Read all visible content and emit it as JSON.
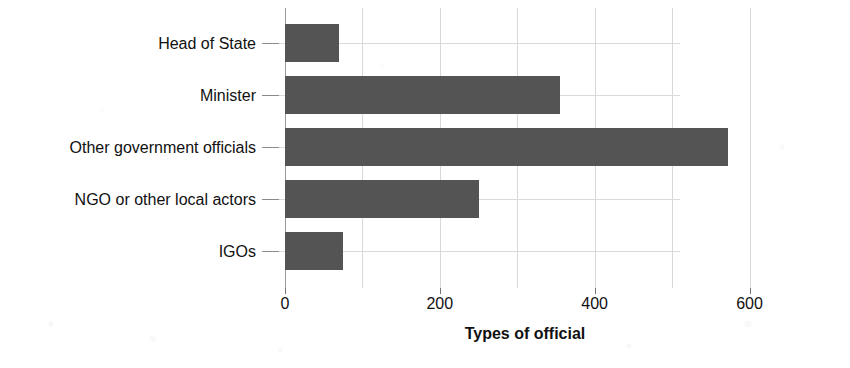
{
  "chart_data": {
    "type": "bar",
    "orientation": "horizontal",
    "title": "",
    "subtitle": "",
    "xlabel": "Types of official",
    "ylabel": "",
    "categories": [
      "Head of State",
      "Minister",
      "Other government officials",
      "NGO or other local actors",
      "IGOs"
    ],
    "values": [
      70,
      355,
      572,
      250,
      75
    ],
    "series": [
      {
        "name": "Types of official",
        "values": [
          70,
          355,
          572,
          250,
          75
        ]
      }
    ],
    "xlim": [
      0,
      620
    ],
    "ylim": null,
    "x_ticks": [
      0,
      200,
      400,
      600
    ],
    "x_tick_labels": [
      "0",
      "200",
      "400",
      "600"
    ],
    "minor_gridlines_step": 100,
    "grid": true,
    "legend": false,
    "legend_position": "none",
    "bar_color": "#555455",
    "grid_color": "#d8d8d8",
    "axis_color": "#9a9a9a",
    "text_color": "#111111",
    "background": "#ffffff"
  },
  "axis": {
    "x_title": "Types of official"
  }
}
